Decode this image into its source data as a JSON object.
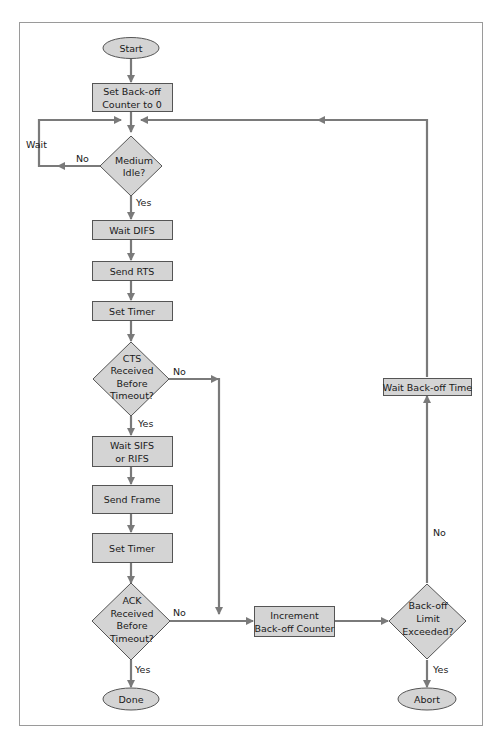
{
  "diagram": {
    "type": "flowchart",
    "colors": {
      "node_fill": "#d4d4d4",
      "node_stroke": "#555555",
      "edge": "#7a7a7a",
      "frame": "#999999",
      "text": "#1a1a1a"
    },
    "nodes": {
      "start": {
        "shape": "ellipse",
        "label": "Start"
      },
      "set_counter": {
        "shape": "rect",
        "line1": "Set Back-off",
        "line2": "Counter to 0"
      },
      "medium_idle": {
        "shape": "diamond",
        "line1": "Medium",
        "line2": "Idle?"
      },
      "wait_difs": {
        "shape": "rect",
        "label": "Wait DIFS"
      },
      "send_rts": {
        "shape": "rect",
        "label": "Send RTS"
      },
      "set_timer_1": {
        "shape": "rect",
        "label": "Set Timer"
      },
      "cts_received": {
        "shape": "diamond",
        "line1": "CTS",
        "line2": "Received",
        "line3": "Before",
        "line4": "Timeout?"
      },
      "wait_sifs": {
        "shape": "rect",
        "line1": "Wait SIFS",
        "line2": "or RIFS"
      },
      "send_frame": {
        "shape": "rect",
        "label": "Send Frame"
      },
      "set_timer_2": {
        "shape": "rect",
        "label": "Set Timer"
      },
      "ack_received": {
        "shape": "diamond",
        "line1": "ACK",
        "line2": "Received",
        "line3": "Before",
        "line4": "Timeout?"
      },
      "done": {
        "shape": "ellipse",
        "label": "Done"
      },
      "increment_counter": {
        "shape": "rect",
        "line1": "Increment",
        "line2": "Back-off Counter"
      },
      "backoff_limit": {
        "shape": "diamond",
        "line1": "Back-off",
        "line2": "Limit",
        "line3": "Exceeded?"
      },
      "abort": {
        "shape": "ellipse",
        "label": "Abort"
      },
      "wait_backoff_time": {
        "shape": "rect",
        "label": "Wait Back-off Time"
      }
    },
    "edge_labels": {
      "wait": "Wait",
      "idle_no": "No",
      "idle_yes": "Yes",
      "cts_no": "No",
      "cts_yes": "Yes",
      "ack_no": "No",
      "ack_yes": "Yes",
      "limit_no": "No",
      "limit_yes": "Yes"
    },
    "edges": [
      {
        "from": "Start",
        "to": "Set Back-off Counter to 0"
      },
      {
        "from": "Set Back-off Counter to 0",
        "to": "Medium Idle?"
      },
      {
        "from": "Medium Idle?",
        "to": "Medium Idle?",
        "label": "No / Wait"
      },
      {
        "from": "Medium Idle?",
        "to": "Wait DIFS",
        "label": "Yes"
      },
      {
        "from": "Wait DIFS",
        "to": "Send RTS"
      },
      {
        "from": "Send RTS",
        "to": "Set Timer"
      },
      {
        "from": "Set Timer",
        "to": "CTS Received Before Timeout?"
      },
      {
        "from": "CTS Received Before Timeout?",
        "to": "Wait SIFS or RIFS",
        "label": "Yes"
      },
      {
        "from": "CTS Received Before Timeout?",
        "to": "Increment Back-off Counter",
        "label": "No"
      },
      {
        "from": "Wait SIFS or RIFS",
        "to": "Send Frame"
      },
      {
        "from": "Send Frame",
        "to": "Set Timer"
      },
      {
        "from": "Set Timer",
        "to": "ACK Received Before Timeout?"
      },
      {
        "from": "ACK Received Before Timeout?",
        "to": "Done",
        "label": "Yes"
      },
      {
        "from": "ACK Received Before Timeout?",
        "to": "Increment Back-off Counter",
        "label": "No"
      },
      {
        "from": "Increment Back-off Counter",
        "to": "Back-off Limit Exceeded?"
      },
      {
        "from": "Back-off Limit Exceeded?",
        "to": "Abort",
        "label": "Yes"
      },
      {
        "from": "Back-off Limit Exceeded?",
        "to": "Wait Back-off Time",
        "label": "No"
      },
      {
        "from": "Wait Back-off Time",
        "to": "Medium Idle?"
      }
    ]
  }
}
